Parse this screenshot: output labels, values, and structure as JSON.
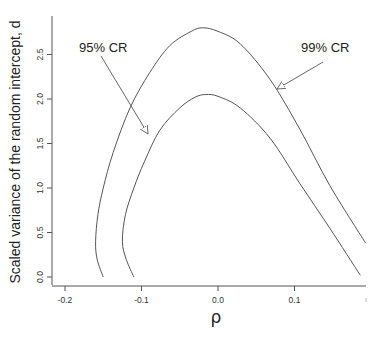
{
  "chart_data": {
    "type": "line",
    "title": "",
    "xlabel": "ρ",
    "ylabel": "Scaled variance of the random intercept, d",
    "xlim": [
      -0.215,
      0.195
    ],
    "ylim": [
      -0.08,
      2.95
    ],
    "xticks": [
      -0.2,
      -0.1,
      0.0,
      0.1
    ],
    "xtick_labels": [
      "-0.2",
      "-0.1",
      "0.0",
      "0.1"
    ],
    "yticks": [
      0.0,
      0.5,
      1.0,
      1.5,
      2.0,
      2.5
    ],
    "ytick_labels": [
      "0.0",
      "0.5",
      "1.0",
      "1.5",
      "2.0",
      "2.5"
    ],
    "grid": false,
    "legend": "none (annotations with arrows)",
    "series": [
      {
        "name": "99% CR",
        "points": [
          [
            -0.15,
            0.0
          ],
          [
            -0.158,
            0.2
          ],
          [
            -0.16,
            0.4
          ],
          [
            -0.157,
            0.7
          ],
          [
            -0.15,
            1.0
          ],
          [
            -0.137,
            1.4
          ],
          [
            -0.115,
            1.9
          ],
          [
            -0.089,
            2.3
          ],
          [
            -0.063,
            2.6
          ],
          [
            -0.035,
            2.76
          ],
          [
            -0.02,
            2.8
          ],
          [
            0.0,
            2.76
          ],
          [
            0.029,
            2.62
          ],
          [
            0.068,
            2.22
          ],
          [
            0.107,
            1.66
          ],
          [
            0.146,
            1.03
          ],
          [
            0.193,
            0.38
          ]
        ]
      },
      {
        "name": "95% CR",
        "points": [
          [
            -0.11,
            0.0
          ],
          [
            -0.12,
            0.2
          ],
          [
            -0.125,
            0.4
          ],
          [
            -0.121,
            0.7
          ],
          [
            -0.11,
            1.0
          ],
          [
            -0.096,
            1.3
          ],
          [
            -0.076,
            1.65
          ],
          [
            -0.05,
            1.9
          ],
          [
            -0.03,
            2.02
          ],
          [
            -0.016,
            2.05
          ],
          [
            0.0,
            2.03
          ],
          [
            0.029,
            1.9
          ],
          [
            0.068,
            1.56
          ],
          [
            0.107,
            1.05
          ],
          [
            0.146,
            0.55
          ],
          [
            0.186,
            0.02
          ]
        ]
      }
    ],
    "annotations": [
      {
        "text": "95% CR",
        "arrow_to_series": "95% CR"
      },
      {
        "text": "99% CR",
        "arrow_to_series": "99% CR"
      }
    ]
  }
}
